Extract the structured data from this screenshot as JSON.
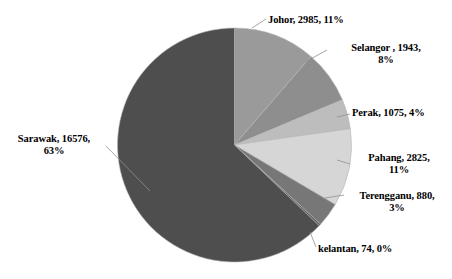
{
  "chart_data": {
    "type": "pie",
    "title": "",
    "subtitle": "",
    "xlabel": "",
    "ylabel": "",
    "legend_position": "none",
    "grid": false,
    "label_format": "name, value, percent",
    "start_angle_deg": 0,
    "direction": "clockwise",
    "total": 26358,
    "categories": [
      "Johor",
      "Selangor ",
      "Perak",
      "Pahang",
      "Terengganu",
      "kelantan",
      "Sarawak"
    ],
    "values": [
      2985,
      1943,
      1075,
      2825,
      880,
      74,
      16576
    ],
    "percents": [
      11,
      8,
      4,
      11,
      3,
      0,
      63
    ],
    "colors": [
      "#9a9a9a",
      "#8e8e8e",
      "#bdbdbd",
      "#d6d6d6",
      "#777777",
      "#5a5a5a",
      "#4e4e4e"
    ],
    "slices": [
      {
        "name": "Johor",
        "value": 2985,
        "percent": 11,
        "label": "Johor, 2985, 11%",
        "color": "#9a9a9a",
        "start_deg": 0.0,
        "sweep_deg": 40.77
      },
      {
        "name": "Selangor ",
        "value": 1943,
        "percent": 8,
        "label": "Selangor , 1943, 8%",
        "color": "#8e8e8e",
        "start_deg": 40.77,
        "sweep_deg": 26.54
      },
      {
        "name": "Perak",
        "value": 1075,
        "percent": 4,
        "label": "Perak, 1075, 4%",
        "color": "#bdbdbd",
        "start_deg": 67.31,
        "sweep_deg": 14.68
      },
      {
        "name": "Pahang",
        "value": 2825,
        "percent": 11,
        "label": "Pahang, 2825, 11%",
        "color": "#d6d6d6",
        "start_deg": 81.99,
        "sweep_deg": 38.58
      },
      {
        "name": "Terengganu",
        "value": 880,
        "percent": 3,
        "label": "Terengganu, 880, 3%",
        "color": "#777777",
        "start_deg": 120.57,
        "sweep_deg": 12.02
      },
      {
        "name": "kelantan",
        "value": 74,
        "percent": 0,
        "label": "kelantan, 74, 0%",
        "color": "#5a5a5a",
        "start_deg": 132.59,
        "sweep_deg": 1.01
      },
      {
        "name": "Sarawak",
        "value": 16576,
        "percent": 63,
        "label": "Sarawak, 16576, 63%",
        "color": "#4e4e4e",
        "start_deg": 133.6,
        "sweep_deg": 226.4
      }
    ]
  },
  "labels": {
    "johor": "Johor, 2985, 11%",
    "selangor_line1": "Selangor , 1943,",
    "selangor_line2": "8%",
    "perak": "Perak, 1075, 4%",
    "pahang_line1": "Pahang, 2825,",
    "pahang_line2": "11%",
    "terengganu_line1": "Terengganu, 880,",
    "terengganu_line2": "3%",
    "kelantan": "kelantan, 74, 0%",
    "sarawak_line1": "Sarawak, 16576,",
    "sarawak_line2": "63%"
  }
}
